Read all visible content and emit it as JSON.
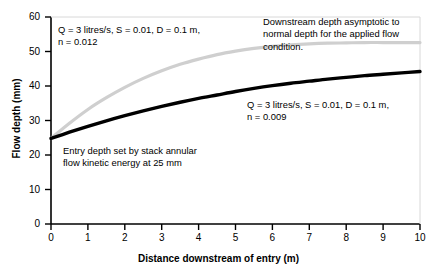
{
  "chart_data": {
    "type": "line",
    "title": "",
    "xlabel": "Distance downstream of entry (m)",
    "ylabel": "Flow depth (mm)",
    "xlim": [
      0,
      10
    ],
    "ylim": [
      0,
      60
    ],
    "xticks": [
      "0",
      "1",
      "2",
      "3",
      "4",
      "5",
      "6",
      "7",
      "8",
      "9",
      "10"
    ],
    "yticks": [
      "0",
      "10",
      "20",
      "30",
      "40",
      "50",
      "60"
    ],
    "grid": false,
    "legend_position": "none",
    "x": [
      0,
      0.5,
      1,
      1.5,
      2,
      2.5,
      3,
      3.5,
      4,
      4.5,
      5,
      5.5,
      6,
      6.5,
      7,
      7.5,
      8,
      8.5,
      9,
      9.5,
      10
    ],
    "series": [
      {
        "name": "n = 0.012",
        "color": "#cfcfcf",
        "width": 3.2,
        "values": [
          24.8,
          29.2,
          33.2,
          36.6,
          39.6,
          42.2,
          44.4,
          46.3,
          47.8,
          49.1,
          50.1,
          50.9,
          51.5,
          51.9,
          52.2,
          52.4,
          52.5,
          52.6,
          52.6,
          52.6,
          52.6
        ]
      },
      {
        "name": "n = 0.009",
        "color": "#000000",
        "width": 3.4,
        "values": [
          24.8,
          26.6,
          28.3,
          29.9,
          31.4,
          32.8,
          34.1,
          35.3,
          36.4,
          37.4,
          38.4,
          39.3,
          40.1,
          40.8,
          41.4,
          42.0,
          42.5,
          43.0,
          43.4,
          43.8,
          44.2
        ]
      }
    ],
    "annotations": [
      {
        "name": "upper-curve-parameters",
        "text": "Q = 3 litres/s, S = 0.01, D = 0.1 m,\nn = 0.012"
      },
      {
        "name": "asymptote-note",
        "text": "Downstream depth asymptotic to\nnormal depth for the applied flow\ncondition."
      },
      {
        "name": "lower-curve-parameters",
        "text": "Q = 3 litres/s, S = 0.01, D = 0.1 m,\nn = 0.009"
      },
      {
        "name": "entry-depth-note",
        "text": "Entry depth set by stack annular\nflow kinetic energy at 25 mm"
      }
    ]
  },
  "annotations": {
    "top_left_line1": "Q = 3 litres/s, S = 0.01, D = 0.1 m,",
    "top_left_line2": "n = 0.012",
    "top_right_line1": "Downstream depth asymptotic to",
    "top_right_line2": "normal depth for the applied flow",
    "top_right_line3": "condition.",
    "right_line1": "Q = 3 litres/s, S = 0.01, D = 0.1 m,",
    "right_line2": "n = 0.009",
    "bottom_left_line1": "Entry depth set by stack annular",
    "bottom_left_line2": "flow kinetic energy at 25 mm"
  },
  "axes": {
    "x_title": "Distance downstream of entry (m)",
    "y_title": "Flow depth (mm)",
    "x_ticks": [
      "0",
      "1",
      "2",
      "3",
      "4",
      "5",
      "6",
      "7",
      "8",
      "9",
      "10"
    ],
    "y_ticks": [
      "0",
      "10",
      "20",
      "30",
      "40",
      "50",
      "60"
    ]
  },
  "colors": {
    "axis": "#000000",
    "series_upper": "#cfcfcf",
    "series_lower": "#000000",
    "background": "#ffffff"
  }
}
